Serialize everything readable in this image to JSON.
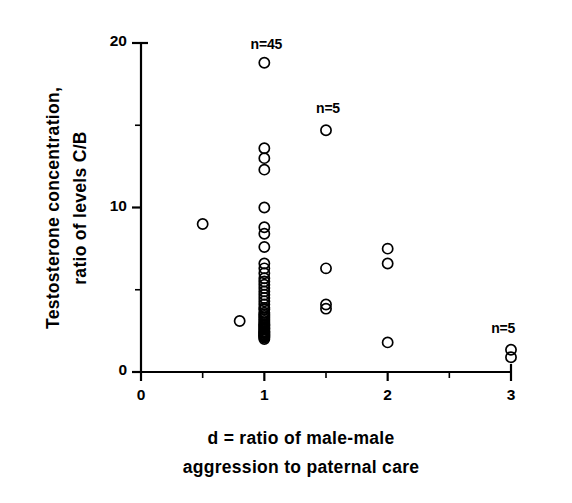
{
  "figure": {
    "background_color": "#ffffff",
    "ink_color": "#000000",
    "marker": "open-circle"
  },
  "axes": {
    "y_title_line1": "Testosterone concentration,",
    "y_title_line2": "ratio of levels C/B",
    "x_title_line1": "d = ratio of male-male",
    "x_title_line2": "aggression to paternal care",
    "y_ticks": [
      {
        "value": 0,
        "label": "0"
      },
      {
        "value": 5,
        "label": ""
      },
      {
        "value": 10,
        "label": "10"
      },
      {
        "value": 15,
        "label": ""
      },
      {
        "value": 20,
        "label": "20"
      }
    ],
    "x_ticks": [
      {
        "value": 0,
        "label": "0"
      },
      {
        "value": 0.5,
        "label": ""
      },
      {
        "value": 1,
        "label": "1"
      },
      {
        "value": 1.5,
        "label": ""
      },
      {
        "value": 2,
        "label": "2"
      },
      {
        "value": 2.5,
        "label": ""
      },
      {
        "value": 3,
        "label": "3"
      }
    ]
  },
  "annotations": [
    {
      "text": "n=45",
      "x": 1.0,
      "y": 19.9
    },
    {
      "text": "n=5",
      "x": 1.5,
      "y": 16.0
    },
    {
      "text": "n=5",
      "x": 2.92,
      "y": 2.6
    }
  ],
  "chart_data": {
    "type": "scatter",
    "title": "",
    "xlabel": "d = ratio of male-male aggression to paternal care",
    "ylabel": "Testosterone concentration, ratio of levels C/B",
    "xlim": [
      0,
      3
    ],
    "ylim": [
      0,
      20
    ],
    "grid": false,
    "legend": "none",
    "marker_style": "open circle",
    "groups": [
      {
        "name": "d=0.5",
        "n_label": "",
        "x": 0.5,
        "values": [
          9.0
        ]
      },
      {
        "name": "d=0.8",
        "n_label": "",
        "x": 0.8,
        "values": [
          3.1
        ]
      },
      {
        "name": "d=1",
        "n_label": "n=45",
        "x": 1.0,
        "values": [
          18.8,
          13.6,
          13.0,
          12.3,
          10.0,
          8.8,
          8.4,
          7.6,
          6.6,
          6.3,
          6.0,
          5.7,
          5.5,
          5.3,
          5.1,
          4.9,
          4.7,
          4.5,
          4.3,
          4.1,
          3.9,
          3.8,
          3.6,
          3.5,
          3.4,
          3.3,
          3.2,
          3.1,
          3.0,
          2.9,
          2.85,
          2.8,
          2.7,
          2.65,
          2.6,
          2.5,
          2.45,
          2.4,
          2.35,
          2.3,
          2.25,
          2.2,
          2.15,
          2.1,
          2.0
        ]
      },
      {
        "name": "d=1.5",
        "n_label": "n=5",
        "x": 1.5,
        "values": [
          14.7,
          6.3,
          4.1,
          3.85,
          3.8
        ]
      },
      {
        "name": "d=2",
        "n_label": "",
        "x": 2.0,
        "values": [
          7.5,
          6.6,
          1.8
        ]
      },
      {
        "name": "d=3",
        "n_label": "n=5",
        "x": 3.0,
        "values": [
          1.35,
          0.9
        ]
      }
    ],
    "points": [
      {
        "x": 0.5,
        "y": 9.0
      },
      {
        "x": 0.8,
        "y": 3.1
      },
      {
        "x": 1.0,
        "y": 18.8
      },
      {
        "x": 1.0,
        "y": 13.6
      },
      {
        "x": 1.0,
        "y": 13.0
      },
      {
        "x": 1.0,
        "y": 12.3
      },
      {
        "x": 1.0,
        "y": 10.0
      },
      {
        "x": 1.0,
        "y": 8.8
      },
      {
        "x": 1.0,
        "y": 8.4
      },
      {
        "x": 1.0,
        "y": 7.6
      },
      {
        "x": 1.0,
        "y": 6.6
      },
      {
        "x": 1.0,
        "y": 6.3
      },
      {
        "x": 1.0,
        "y": 6.0
      },
      {
        "x": 1.0,
        "y": 5.7
      },
      {
        "x": 1.0,
        "y": 5.5
      },
      {
        "x": 1.0,
        "y": 5.3
      },
      {
        "x": 1.0,
        "y": 5.1
      },
      {
        "x": 1.0,
        "y": 4.9
      },
      {
        "x": 1.0,
        "y": 4.7
      },
      {
        "x": 1.0,
        "y": 4.5
      },
      {
        "x": 1.0,
        "y": 4.3
      },
      {
        "x": 1.0,
        "y": 4.1
      },
      {
        "x": 1.0,
        "y": 3.9
      },
      {
        "x": 1.0,
        "y": 3.8
      },
      {
        "x": 1.0,
        "y": 3.6
      },
      {
        "x": 1.0,
        "y": 3.5
      },
      {
        "x": 1.0,
        "y": 3.4
      },
      {
        "x": 1.0,
        "y": 3.3
      },
      {
        "x": 1.0,
        "y": 3.2
      },
      {
        "x": 1.0,
        "y": 3.1
      },
      {
        "x": 1.0,
        "y": 3.0
      },
      {
        "x": 1.0,
        "y": 2.9
      },
      {
        "x": 1.0,
        "y": 2.85
      },
      {
        "x": 1.0,
        "y": 2.8
      },
      {
        "x": 1.0,
        "y": 2.7
      },
      {
        "x": 1.0,
        "y": 2.65
      },
      {
        "x": 1.0,
        "y": 2.6
      },
      {
        "x": 1.0,
        "y": 2.5
      },
      {
        "x": 1.0,
        "y": 2.45
      },
      {
        "x": 1.0,
        "y": 2.4
      },
      {
        "x": 1.0,
        "y": 2.35
      },
      {
        "x": 1.0,
        "y": 2.3
      },
      {
        "x": 1.0,
        "y": 2.25
      },
      {
        "x": 1.0,
        "y": 2.2
      },
      {
        "x": 1.0,
        "y": 2.15
      },
      {
        "x": 1.0,
        "y": 2.1
      },
      {
        "x": 1.0,
        "y": 2.0
      },
      {
        "x": 1.5,
        "y": 14.7
      },
      {
        "x": 1.5,
        "y": 6.3
      },
      {
        "x": 1.5,
        "y": 4.1
      },
      {
        "x": 1.5,
        "y": 3.85
      },
      {
        "x": 2.0,
        "y": 7.5
      },
      {
        "x": 2.0,
        "y": 6.6
      },
      {
        "x": 2.0,
        "y": 1.8
      },
      {
        "x": 3.0,
        "y": 1.35
      },
      {
        "x": 3.0,
        "y": 0.9
      }
    ]
  }
}
